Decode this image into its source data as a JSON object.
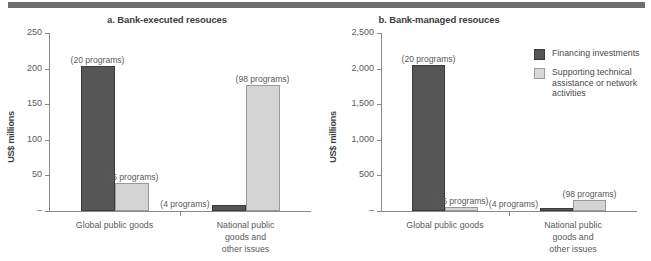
{
  "figure": {
    "top_rule_color": "#6e6e6e",
    "dark_color": "#565656",
    "light_color": "#d4d4d4"
  },
  "legend": {
    "items": [
      {
        "label": "Financing investments",
        "swatch": "dark"
      },
      {
        "label": "Supporting technical assistance or network activities",
        "swatch": "light"
      }
    ]
  },
  "chart_data": [
    {
      "type": "bar",
      "panel_id": "a",
      "title": "a. Bank-executed resouces",
      "xlabel": "",
      "ylabel": "US$ millions",
      "ylim": [
        0,
        250
      ],
      "yticks": [
        "–",
        "50",
        "100",
        "150",
        "200",
        "250"
      ],
      "ytick_values": [
        0,
        50,
        100,
        150,
        200,
        250
      ],
      "grid": false,
      "legend_position": "right-outside",
      "categories": [
        "Global public goods",
        "National public goods and\nother issues"
      ],
      "series": [
        {
          "name": "Financing investments",
          "values": [
            204,
            8
          ],
          "annotations": [
            "(20 programs)",
            "(4 programs)"
          ]
        },
        {
          "name": "Supporting technical assistance or network activities",
          "values": [
            39,
            177
          ],
          "annotations": [
            "(36 programs)",
            "(98 programs)"
          ]
        }
      ]
    },
    {
      "type": "bar",
      "panel_id": "b",
      "title": "b. Bank-managed resouces",
      "xlabel": "",
      "ylabel": "US$ millions",
      "ylim": [
        0,
        2500
      ],
      "yticks": [
        "–",
        "500",
        "1,000",
        "1,500",
        "2,000",
        "2,500"
      ],
      "ytick_values": [
        0,
        500,
        1000,
        1500,
        2000,
        2500
      ],
      "grid": false,
      "legend_position": "right-outside",
      "categories": [
        "Global public goods",
        "National public goods and\nother issues"
      ],
      "series": [
        {
          "name": "Financing investments",
          "values": [
            2050,
            25
          ],
          "annotations": [
            "(20 programs)",
            "(4 programs)"
          ]
        },
        {
          "name": "Supporting technical assistance or network activities",
          "values": [
            55,
            160
          ],
          "annotations": [
            "(36 programs)",
            "(98 programs)"
          ]
        }
      ]
    }
  ]
}
